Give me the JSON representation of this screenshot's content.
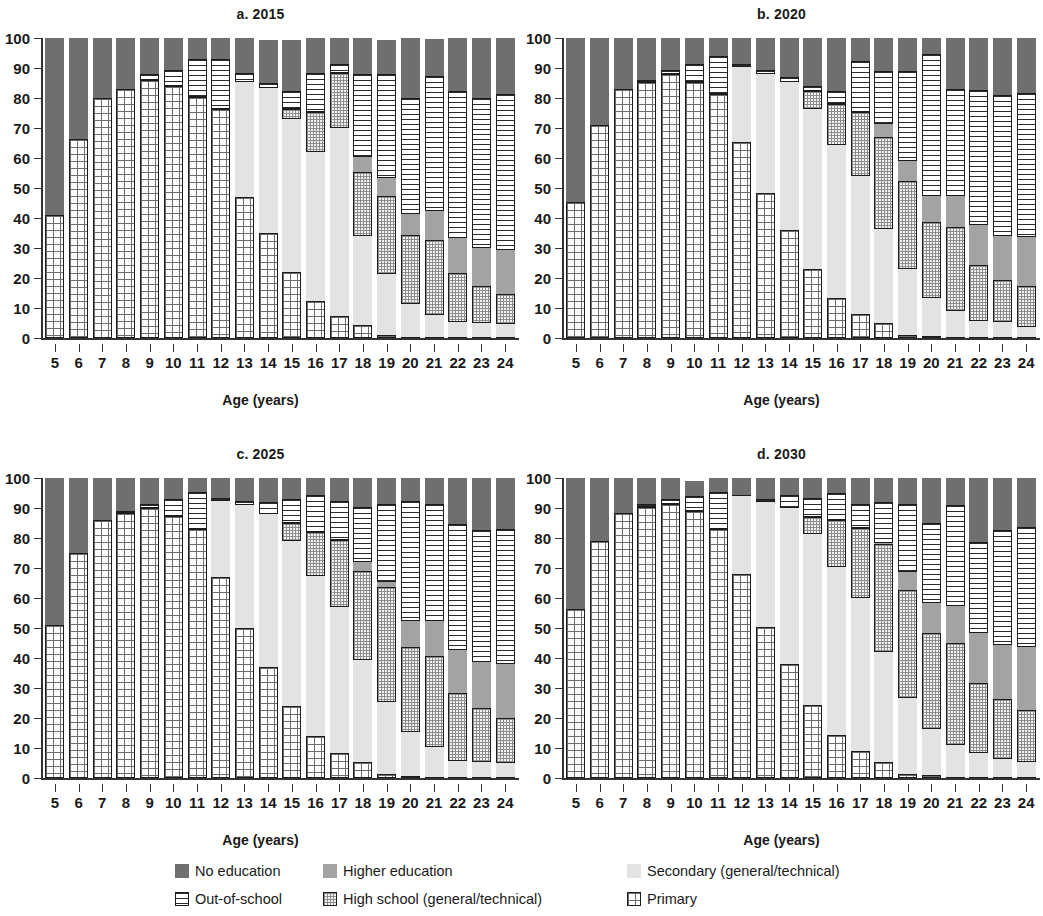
{
  "axis": {
    "y_ticks": [
      0,
      10,
      20,
      30,
      40,
      50,
      60,
      70,
      80,
      90,
      100
    ],
    "x_ticks": [
      5,
      6,
      7,
      8,
      9,
      10,
      11,
      12,
      13,
      14,
      15,
      16,
      17,
      18,
      19,
      20,
      21,
      22,
      23,
      24
    ],
    "x_title": "Age (years)"
  },
  "panels": [
    {
      "id": "a",
      "title": "a. 2015"
    },
    {
      "id": "b",
      "title": "b. 2020"
    },
    {
      "id": "c",
      "title": "c. 2025"
    },
    {
      "id": "d",
      "title": "d. 2030"
    }
  ],
  "legend": {
    "items": [
      {
        "key": "no_education",
        "label": "No education",
        "color": "#6f6f6f",
        "pattern": "solid-dark"
      },
      {
        "key": "higher_education",
        "label": "Higher education",
        "color": "#a3a3a3",
        "pattern": "solid-medium"
      },
      {
        "key": "secondary",
        "label": "Secondary (general/technical)",
        "color": "#e3e3e3",
        "pattern": "solid-light"
      },
      {
        "key": "out_of_school",
        "label": "Out-of-school",
        "color": "#ffffff",
        "pattern": "horizontal-lines"
      },
      {
        "key": "high_school",
        "label": "High school (general/technical)",
        "color": "#f2f2f2",
        "pattern": "cross-hatch-fine"
      },
      {
        "key": "primary",
        "label": "Primary",
        "color": "#ffffff",
        "pattern": "grid"
      }
    ]
  },
  "chart_data": {
    "type": "bar",
    "subtype": "stacked-100-percent",
    "xlabel": "Age (years)",
    "ylabel": "",
    "ylim": [
      0,
      100
    ],
    "grid": false,
    "legend_position": "bottom",
    "categories": [
      5,
      6,
      7,
      8,
      9,
      10,
      11,
      12,
      13,
      14,
      15,
      16,
      17,
      18,
      19,
      20,
      21,
      22,
      23,
      24
    ],
    "stack_order_bottom_to_top": [
      "primary",
      "secondary",
      "high_school",
      "higher_education",
      "out_of_school",
      "no_education"
    ],
    "panels": [
      {
        "id": "a",
        "title": "a. 2015",
        "series": [
          {
            "name": "primary",
            "values": [
              41,
              66.5,
              80,
              83,
              86,
              84,
              80.5,
              76.5,
              47,
              35,
              22,
              12.5,
              7.5,
              4.5,
              1,
              0.5,
              0.3,
              0.2,
              0.2,
              0.2
            ]
          },
          {
            "name": "secondary",
            "values": [
              0,
              0,
              0,
              0,
              0,
              0,
              0,
              0,
              38.5,
              48.5,
              51,
              49.5,
              62.5,
              29.5,
              20.5,
              11,
              7.5,
              5,
              4.8,
              4.5
            ]
          },
          {
            "name": "high_school",
            "values": [
              0,
              0,
              0,
              0,
              0,
              0,
              0,
              0,
              0,
              0,
              3.5,
              13.5,
              18.5,
              21.5,
              26,
              23,
              25,
              16.5,
              12.5,
              10
            ]
          },
          {
            "name": "higher_education",
            "values": [
              0,
              0,
              0,
              0,
              0,
              0,
              0,
              0,
              0,
              0,
              0,
              0,
              0,
              5,
              6,
              7,
              9.5,
              11.5,
              12.5,
              14.5
            ]
          },
          {
            "name": "out_of_school",
            "values": [
              0,
              0,
              0,
              0,
              2,
              5.5,
              12.5,
              16.5,
              3,
              1.5,
              6,
              13,
              3,
              27.5,
              34.5,
              38.5,
              45,
              49,
              50,
              52
            ]
          },
          {
            "name": "no_education",
            "values": [
              59,
              33.5,
              20,
              17,
              12,
              10.5,
              7,
              7,
              11.5,
              14.5,
              17,
              11.5,
              8.5,
              12,
              11.5,
              20,
              12.5,
              17.8,
              20,
              18.8
            ]
          }
        ]
      },
      {
        "id": "b",
        "title": "b. 2020",
        "series": [
          {
            "name": "primary",
            "values": [
              45.5,
              71,
              83,
              85.5,
              88,
              85.5,
              81.5,
              65.5,
              48.5,
              36,
              23,
              13.5,
              8,
              5,
              1,
              0.8,
              0.4,
              0.2,
              0.2,
              0.2
            ]
          },
          {
            "name": "secondary",
            "values": [
              0,
              0,
              0,
              0,
              0,
              0,
              0,
              25,
              39.5,
              49.5,
              53.5,
              51,
              46,
              31.5,
              22,
              12.5,
              8.5,
              5.5,
              5.3,
              3.5
            ]
          },
          {
            "name": "high_school",
            "values": [
              0,
              0,
              0,
              0,
              0,
              0,
              0,
              0,
              0,
              0,
              6,
              13.5,
              21.5,
              30.5,
              29.5,
              25.5,
              28,
              18.5,
              14,
              13.5
            ]
          },
          {
            "name": "higher_education",
            "values": [
              0,
              0,
              0,
              0,
              0,
              0,
              0,
              0,
              0,
              0,
              0,
              0,
              0,
              4.5,
              6.5,
              8.5,
              10.5,
              13.5,
              14.5,
              16.5
            ]
          },
          {
            "name": "out_of_school",
            "values": [
              0,
              0,
              0,
              0.5,
              1.5,
              6,
              12.5,
              0.8,
              1.5,
              1.5,
              1.5,
              4.5,
              17,
              17.5,
              30,
              47.5,
              35.5,
              45,
              47,
              48
            ]
          },
          {
            "name": "no_education",
            "values": [
              54.5,
              29,
              17,
              14,
              10.5,
              8.5,
              6,
              8.7,
              10.5,
              13,
              16,
              17.5,
              7.5,
              11,
              11,
              5.2,
              17.1,
              17.3,
              19,
              18.3
            ]
          }
        ]
      },
      {
        "id": "c",
        "title": "c. 2025",
        "series": [
          {
            "name": "primary",
            "values": [
              51,
              75,
              86,
              88.5,
              90,
              87.5,
              83,
              67,
              50,
              37,
              24,
              14,
              8.5,
              5.5,
              1.2,
              0.8,
              0.3,
              0.2,
              0.2,
              0.2
            ]
          },
          {
            "name": "secondary",
            "values": [
              0,
              0,
              0,
              0,
              0,
              0,
              0,
              25.5,
              41,
              51,
              55,
              53.5,
              48.5,
              34,
              24,
              14.5,
              10,
              5.5,
              5,
              4.8
            ]
          },
          {
            "name": "high_school",
            "values": [
              0,
              0,
              0,
              0,
              0,
              0,
              0,
              0,
              0,
              0,
              6,
              14.5,
              22.5,
              29.5,
              38.5,
              28.5,
              30.5,
              22.5,
              18,
              15
            ]
          },
          {
            "name": "higher_education",
            "values": [
              0,
              0,
              0,
              0,
              0,
              0,
              0,
              0,
              0,
              0,
              0,
              0,
              0,
              3,
              1.5,
              8.5,
              11.5,
              14.5,
              15.5,
              18
            ]
          },
          {
            "name": "out_of_school",
            "values": [
              0,
              0,
              0,
              0.5,
              1.5,
              5.5,
              12.5,
              0.7,
              1.5,
              4,
              8,
              12.5,
              13,
              18.5,
              26,
              40,
              39,
              42,
              44,
              45
            ]
          },
          {
            "name": "no_education",
            "values": [
              49,
              25,
              14,
              11,
              8.5,
              7,
              4.5,
              6.8,
              7.5,
              8,
              7,
              5.5,
              7.5,
              9.5,
              8.8,
              7.7,
              8.7,
              15.3,
              17.3,
              17
            ]
          }
        ]
      },
      {
        "id": "d",
        "title": "d. 2030",
        "series": [
          {
            "name": "primary",
            "values": [
              56.5,
              79,
              88.5,
              90.5,
              91.5,
              89,
              83,
              68,
              50.5,
              38,
              24.5,
              14.5,
              9,
              5.5,
              1.3,
              1,
              0.4,
              0.2,
              0.2,
              0.2
            ]
          },
          {
            "name": "secondary",
            "values": [
              0,
              0,
              0,
              0,
              0,
              0,
              0,
              26,
              41.5,
              52,
              57,
              56,
              51,
              36.5,
              25.5,
              15.5,
              10.5,
              8,
              6,
              5
            ]
          },
          {
            "name": "high_school",
            "values": [
              0,
              0,
              0,
              0,
              0,
              0,
              0,
              0,
              0,
              0,
              5.5,
              15.5,
              23.5,
              36,
              36,
              32,
              34,
              23.5,
              20,
              17.5
            ]
          },
          {
            "name": "higher_education",
            "values": [
              0,
              0,
              0,
              0,
              0,
              0,
              0,
              0,
              0,
              0,
              0,
              0,
              0,
              0.5,
              6,
              10,
              12.5,
              16.5,
              18,
              21
            ]
          },
          {
            "name": "out_of_school",
            "values": [
              0,
              0,
              0,
              1,
              1.5,
              5,
              12.5,
              0.5,
              1,
              4.5,
              6.5,
              9,
              8,
              13.5,
              22.5,
              26.5,
              33.5,
              30.5,
              38.5,
              40
            ]
          },
          {
            "name": "no_education",
            "values": [
              43.5,
              21,
              11.5,
              8.5,
              7,
              5,
              4.5,
              5.5,
              7,
              5.5,
              6.5,
              5,
              8.5,
              8,
              8.7,
              15,
              9.1,
              21.3,
              17.3,
              16.3
            ]
          }
        ]
      }
    ]
  }
}
